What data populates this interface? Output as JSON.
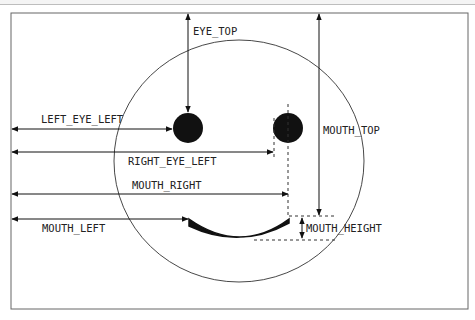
{
  "diagram": {
    "labels": {
      "eye_top": "EYE_TOP",
      "left_eye_left": "LEFT_EYE_LEFT",
      "right_eye_left": "RIGHT_EYE_LEFT",
      "mouth_top": "MOUTH_TOP",
      "mouth_right": "MOUTH_RIGHT",
      "mouth_left": "MOUTH_LEFT",
      "mouth_height": "MOUTH_HEIGHT"
    },
    "shapes": {
      "frame": {
        "x": 11,
        "y": 13,
        "width": 457,
        "height": 296
      },
      "face": {
        "cx": 239,
        "cy": 161,
        "r": 125
      },
      "left_eye": {
        "cx": 188,
        "cy": 128,
        "r": 15
      },
      "right_eye": {
        "cx": 288,
        "cy": 128,
        "r": 15
      },
      "mouth": {
        "left": 189,
        "right": 289,
        "top": 216,
        "bottom": 240
      }
    },
    "colors": {
      "stroke": "#222222",
      "fill": "#111111",
      "frame": "#666666"
    }
  }
}
